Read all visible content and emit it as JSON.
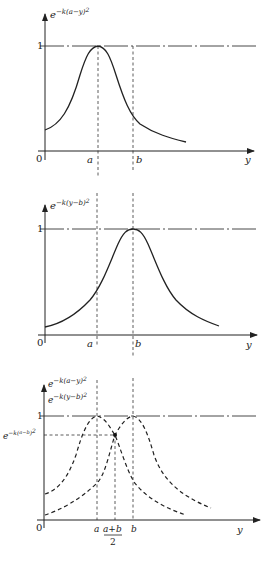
{
  "panels": [
    {
      "id": "panel-1",
      "y_label": "e^{-k(a-y)^2}",
      "y_label_base": "e",
      "y_label_exp": "−k(a−y)",
      "y_label_sq": "2",
      "one_label": "1",
      "origin_label": "0",
      "x_axis_label": "y",
      "ticks": [
        {
          "label": "a"
        },
        {
          "label": "b"
        }
      ],
      "curve": "Gaussian peaking at a"
    },
    {
      "id": "panel-2",
      "y_label": "e^{-k(y-b)^2}",
      "y_label_base": "e",
      "y_label_exp": "−k(y−b)",
      "y_label_sq": "2",
      "one_label": "1",
      "origin_label": "0",
      "x_axis_label": "y",
      "ticks": [
        {
          "label": "a"
        },
        {
          "label": "b"
        }
      ],
      "curve": "Gaussian peaking at b"
    },
    {
      "id": "panel-3",
      "y_label_1_base": "e",
      "y_label_1_exp": "−k(a−y)",
      "y_label_1_sq": "2",
      "y_label_2_base": "e",
      "y_label_2_exp": "−k(y−b)",
      "y_label_2_sq": "2",
      "one_label": "1",
      "level_label_base": "e",
      "level_label_exp": "−k(",
      "level_label_frac_num": "a−b",
      "level_label_frac_den": "2",
      "level_label_close": ")",
      "level_label_sq": "2",
      "origin_label": "0",
      "x_axis_label": "y",
      "ticks": [
        {
          "label": "a"
        },
        {
          "label": "a+b",
          "denominator": "2"
        },
        {
          "label": "b"
        }
      ],
      "curve": "Both Gaussians (dashed) intersecting at (a+b)/2"
    }
  ]
}
